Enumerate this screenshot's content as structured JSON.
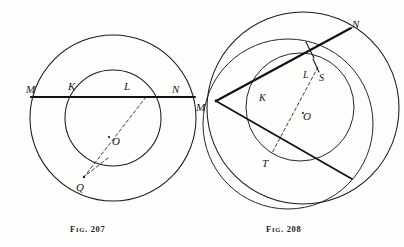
{
  "figure_plate": {
    "background_color": "#fdfdfc",
    "ink_color": "#1b1b1b",
    "figures": [
      {
        "id": "fig-207",
        "caption_prefix": "F",
        "caption_small": "IG",
        "caption_rest": ". 207",
        "caption_text": "Fig. 207",
        "description": "Two concentric circles with a secant line MN cutting the outer circle at M and N and the inner circle at K and L, plus a dashed line from L through center O to point Q on the inner circle.",
        "center": {
          "x": 113,
          "y": 118,
          "label": "O"
        },
        "circles": [
          {
            "name": "outer-circle",
            "cx": 113,
            "cy": 118,
            "r": 83
          },
          {
            "name": "inner-circle",
            "cx": 113,
            "cy": 118,
            "r": 48
          }
        ],
        "points": [
          {
            "label": "M",
            "x": 30,
            "y": 90,
            "px": 33,
            "py": 97
          },
          {
            "label": "K",
            "x": 72,
            "y": 87,
            "px": 80,
            "py": 97
          },
          {
            "label": "L",
            "x": 128,
            "y": 87,
            "px": 146,
            "py": 97
          },
          {
            "label": "N",
            "x": 176,
            "y": 90,
            "px": 193,
            "py": 97
          },
          {
            "label": "O",
            "x": 112,
            "y": 142,
            "px": 113,
            "py": 118
          },
          {
            "label": "Q",
            "x": 76,
            "y": 188,
            "px": 84,
            "py": 177
          }
        ],
        "secant": {
          "name": "secant-MN",
          "x1": 31,
          "y1": 97,
          "x2": 195,
          "y2": 97
        },
        "dashed_lines": [
          {
            "name": "dashed-L-to-Q",
            "x1": 146,
            "y1": 97,
            "x2": 84,
            "y2": 177
          },
          {
            "name": "dashed-short-spur",
            "x1": 106,
            "y1": 160,
            "x2": 84,
            "y2": 177
          }
        ]
      },
      {
        "id": "fig-208",
        "caption_prefix": "F",
        "caption_small": "IG",
        "caption_rest": ". 208",
        "caption_text": "Fig. 208",
        "description": "Three overlapping circles with two secant lines drawn from point M; the upper line passes through K, L and meets the outer circle at N, the lower line passes through T; a dashed line runs from S through center O to T.",
        "center": {
          "x": 307,
          "y": 110,
          "label": "O"
        },
        "circles": [
          {
            "name": "outer-circle",
            "cx": 303,
            "cy": 108,
            "r": 96
          },
          {
            "name": "middle-circle",
            "cx": 288,
            "cy": 124,
            "r": 85
          },
          {
            "name": "inner-circle",
            "cx": 300,
            "cy": 107,
            "r": 54
          }
        ],
        "points": [
          {
            "label": "M",
            "x": 200,
            "y": 107,
            "px": 216,
            "py": 101
          },
          {
            "label": "N",
            "x": 355,
            "y": 24,
            "px": 347,
            "py": 31
          },
          {
            "label": "K",
            "x": 262,
            "y": 97,
            "px": 272,
            "py": 87
          },
          {
            "label": "L",
            "x": 307,
            "y": 74,
            "px": 309,
            "py": 59
          },
          {
            "label": "S",
            "x": 322,
            "y": 77,
            "px": 318,
            "py": 70
          },
          {
            "label": "O",
            "x": 306,
            "y": 116,
            "px": 307,
            "py": 110
          },
          {
            "label": "T",
            "x": 265,
            "y": 163,
            "px": 272,
            "py": 153
          }
        ],
        "secants": [
          {
            "name": "secant-M-to-N",
            "x1": 216,
            "y1": 101,
            "x2": 351,
            "y2": 28
          },
          {
            "name": "secant-M-through-T",
            "x1": 216,
            "y1": 101,
            "x2": 351,
            "y2": 178
          }
        ],
        "dashed_lines": [
          {
            "name": "dashed-S-to-T",
            "x1": 318,
            "y1": 67,
            "x2": 272,
            "y2": 153
          }
        ],
        "tick_marks": [
          {
            "name": "tick-at-L",
            "x1": 306,
            "y1": 43,
            "x2": 314,
            "y2": 58
          },
          {
            "name": "tick-at-S",
            "x1": 314,
            "y1": 60,
            "x2": 320,
            "y2": 72
          }
        ]
      }
    ]
  }
}
